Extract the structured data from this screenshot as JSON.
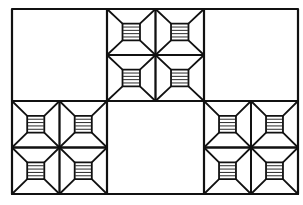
{
  "diagram": {
    "type": "quilt-pattern",
    "stroke_color": "#111111",
    "background": "#ffffff",
    "frame": {
      "x": 12,
      "y": 9,
      "width": 286,
      "height": 185
    },
    "columns": [
      12,
      107,
      204,
      298
    ],
    "rows": [
      9,
      101,
      194
    ],
    "cells": [
      {
        "row": 0,
        "col": 0,
        "kind": "plain"
      },
      {
        "row": 0,
        "col": 1,
        "kind": "block"
      },
      {
        "row": 0,
        "col": 2,
        "kind": "plain"
      },
      {
        "row": 1,
        "col": 0,
        "kind": "block"
      },
      {
        "row": 1,
        "col": 1,
        "kind": "plain"
      },
      {
        "row": 1,
        "col": 2,
        "kind": "block"
      }
    ],
    "block": {
      "units_per_block": 4,
      "unit_inner_square_ratio": 0.36,
      "stripes_per_inner_square": 4
    }
  }
}
